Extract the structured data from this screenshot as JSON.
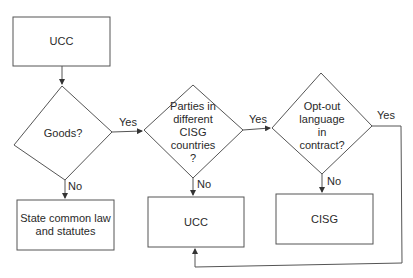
{
  "nodes": {
    "start": {
      "label": "UCC",
      "shape": "rectangle"
    },
    "goods": {
      "label": "Goods?",
      "shape": "diamond"
    },
    "cisg_countries": {
      "label": "Parties in different CISG countries ?",
      "lines": [
        "Parties in",
        "different",
        "CISG",
        "countries",
        "?"
      ],
      "shape": "diamond"
    },
    "opt_out": {
      "label": "Opt-out language in contract?",
      "lines": [
        "Opt-out",
        "language",
        "in",
        "contract?"
      ],
      "shape": "diamond"
    },
    "state_law": {
      "label": "State common law and statutes",
      "lines": [
        "State common law",
        "and statutes"
      ],
      "shape": "rectangle"
    },
    "ucc_result": {
      "label": "UCC",
      "shape": "rectangle"
    },
    "cisg_result": {
      "label": "CISG",
      "shape": "rectangle"
    }
  },
  "edges": [
    {
      "from": "start",
      "to": "goods",
      "label": ""
    },
    {
      "from": "goods",
      "to": "cisg_countries",
      "label": "Yes"
    },
    {
      "from": "goods",
      "to": "state_law",
      "label": "No"
    },
    {
      "from": "cisg_countries",
      "to": "opt_out",
      "label": "Yes"
    },
    {
      "from": "cisg_countries",
      "to": "ucc_result",
      "label": "No"
    },
    {
      "from": "opt_out",
      "to": "cisg_result",
      "label": "No"
    },
    {
      "from": "opt_out",
      "to": "ucc_result",
      "label": "Yes"
    }
  ],
  "labels": {
    "yes": "Yes",
    "no": "No"
  },
  "colors": {
    "stroke": "#4a4a4a",
    "text": "#2a2a2a",
    "background": "#ffffff"
  }
}
